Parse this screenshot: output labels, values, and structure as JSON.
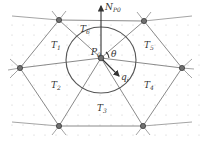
{
  "diagram": {
    "type": "triangular-mesh-neighborhood",
    "center_node": {
      "label": "P",
      "sub": "0"
    },
    "normal_vector": {
      "label": "N",
      "sub": "P0"
    },
    "direction_vector": {
      "label": "q",
      "sub": "i"
    },
    "angle": {
      "label": "θ"
    },
    "triangles": [
      {
        "label": "T",
        "sub": "1"
      },
      {
        "label": "T",
        "sub": "2"
      },
      {
        "label": "T",
        "sub": "3"
      },
      {
        "label": "T",
        "sub": "4"
      },
      {
        "label": "T",
        "sub": "5"
      },
      {
        "label": "T",
        "sub": "6"
      }
    ]
  }
}
